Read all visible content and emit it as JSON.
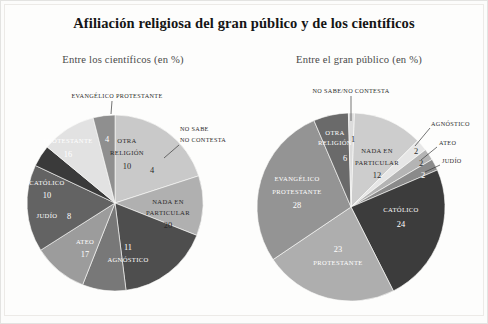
{
  "header": {
    "title": "Afiliación religiosa del gran público y de los científicos",
    "subtitle_left": "Entre los científicos (en %)",
    "subtitle_right": "Entre el gran público (en %)"
  },
  "chart_data": [
    {
      "type": "pie",
      "title": "Entre los científicos (en %)",
      "legend_position": "none",
      "categories": [
        "NADA EN PARTICULAR",
        "AGNÓSTICO",
        "ATEO",
        "JUDÍO",
        "CATÓLICO",
        "PROTESTANTE",
        "EVANGÉLICO PROTESTANTE",
        "OTRA RELIGIÓN",
        "NO SABE/NO CONTESTA"
      ],
      "values": [
        20,
        11,
        17,
        8,
        10,
        16,
        4,
        10,
        4
      ],
      "colors": [
        "#c9c9c9",
        "#b0b0b0",
        "#4e4e4e",
        "#787878",
        "#9c9c9c",
        "#636363",
        "#3a3a3a",
        "#e2e2e2",
        "#8f8f8f"
      ],
      "labels": [
        {
          "name": "NADA EN PARTICULAR",
          "value": "20",
          "placement": "inside"
        },
        {
          "name": "AGNÓSTICO",
          "value": "11",
          "placement": "inside"
        },
        {
          "name": "ATEO",
          "value": "17",
          "placement": "inside"
        },
        {
          "name": "JUDÍO",
          "value": "8",
          "placement": "inside"
        },
        {
          "name": "CATÓLICO",
          "value": "10",
          "placement": "inside"
        },
        {
          "name": "PROTESTANTE",
          "value": "16",
          "placement": "inside"
        },
        {
          "name": "EVANGÉLICO PROTESTANTE",
          "value": "4",
          "placement": "callout"
        },
        {
          "name": "OTRA RELIGIÓN",
          "value": "10",
          "placement": "inside"
        },
        {
          "name": "NO SABE NO CONTESTA",
          "value": "4",
          "placement": "callout"
        }
      ]
    },
    {
      "type": "pie",
      "title": "Entre el gran público (en %)",
      "legend_position": "none",
      "categories": [
        "NADA EN PARTICULAR",
        "AGNÓSTICO",
        "ATEO",
        "JUDÍO",
        "CATÓLICO",
        "PROTESTANTE",
        "EVANGÉLICO PROTESTANTE",
        "OTRA RELIGIÓN",
        "NO SABE/NO CONTESTA"
      ],
      "values": [
        12,
        2,
        2,
        2,
        24,
        23,
        28,
        6,
        1
      ],
      "colors": [
        "#cdcdcd",
        "#e6e6e6",
        "#b4b4b4",
        "#8a8a8a",
        "#3c3c3c",
        "#aeaeae",
        "#949494",
        "#6a6a6a",
        "#dcdcdc"
      ],
      "labels": [
        {
          "name": "NADA EN PARTICULAR",
          "value": "12",
          "placement": "inside"
        },
        {
          "name": "AGNÓSTICO",
          "value": "2",
          "placement": "callout"
        },
        {
          "name": "ATEO",
          "value": "2",
          "placement": "callout"
        },
        {
          "name": "JUDÍO",
          "value": "2",
          "placement": "callout"
        },
        {
          "name": "CATÓLICO",
          "value": "24",
          "placement": "inside"
        },
        {
          "name": "PROTESTANTE",
          "value": "23",
          "placement": "inside"
        },
        {
          "name": "EVANGÉLICO PROTESTANTE",
          "value": "28",
          "placement": "inside"
        },
        {
          "name": "OTRA RELIGIÓN",
          "value": "6",
          "placement": "inside"
        },
        {
          "name": "NO SABE/NO CONTESTA",
          "value": "1",
          "placement": "callout"
        }
      ]
    }
  ],
  "left_chart": {
    "slices": {
      "nada_particular": {
        "label1": "NADA EN",
        "label2": "PARTICULAR",
        "value": "20"
      },
      "agnostico": {
        "label": "AGNÓSTICO",
        "value": "11"
      },
      "ateo": {
        "label": "ATEO",
        "value": "17"
      },
      "judio": {
        "label": "JUDÍO",
        "value": "8"
      },
      "catolico": {
        "label": "CATÓLICO",
        "value": "10"
      },
      "protestante": {
        "label": "PROTESTANTE",
        "value": "16"
      },
      "evangelico": {
        "label": "EVANGÉLICO PROTESTANTE",
        "value": "4"
      },
      "otra_religion": {
        "label1": "OTRA",
        "label2": "RELIGIÓN",
        "value": "10"
      },
      "nosabe": {
        "label1": "NO SABE",
        "label2": "NO CONTESTA",
        "value": "4"
      }
    }
  },
  "right_chart": {
    "slices": {
      "nada_particular": {
        "label1": "NADA EN",
        "label2": "PARTICULAR",
        "value": "12"
      },
      "agnostico": {
        "label": "AGNÓSTICO",
        "value": "2"
      },
      "ateo": {
        "label": "ATEO",
        "value": "2"
      },
      "judio": {
        "label": "JUDÍO",
        "value": "2"
      },
      "catolico": {
        "label": "CATÓLICO",
        "value": "24"
      },
      "protestante": {
        "label": "PROTESTANTE",
        "value": "23"
      },
      "evangelico": {
        "label1": "EVANGÉLICO",
        "label2": "PROTESTANTE",
        "value": "28"
      },
      "otra_religion": {
        "label1": "OTRA",
        "label2": "RELIGIÓN",
        "value": "6"
      },
      "nosabe": {
        "label": "NO SABE/NO CONTESTA",
        "value": "1"
      }
    }
  }
}
